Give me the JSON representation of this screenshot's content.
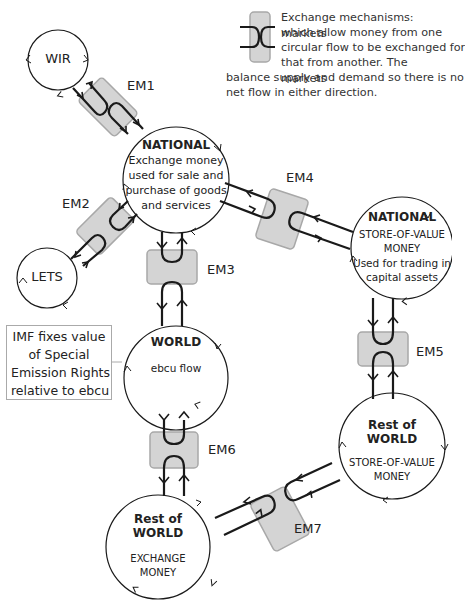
{
  "legend": {
    "icon": "exchange-mechanism-icon",
    "text_lines": [
      "Exchange mechanisms: markets",
      "which allow money from one",
      "circular flow to be exchanged for",
      "that from another. The markets",
      "balance supply and demand so there is no",
      "net flow in either direction."
    ]
  },
  "nodes": {
    "wir": {
      "label": "WIR"
    },
    "lets": {
      "label": "LETS"
    },
    "national_exchange": {
      "title": "NATIONAL",
      "lines": [
        "Exchange money",
        "used for sale and",
        "purchase of goods",
        "and services"
      ]
    },
    "national_store": {
      "title": "NATIONAL",
      "lines": [
        "STORE-OF-VALUE",
        "MONEY",
        "Used for trading in",
        "capital assets"
      ]
    },
    "world": {
      "title": "WORLD",
      "subtitle": "ebcu flow"
    },
    "rest_world_store": {
      "title_lines": [
        "Rest of",
        "WORLD"
      ],
      "lines": [
        "STORE-OF-VALUE",
        "MONEY"
      ]
    },
    "rest_world_exchange": {
      "title_lines": [
        "Rest of",
        "WORLD"
      ],
      "lines": [
        "EXCHANGE",
        "MONEY"
      ]
    }
  },
  "exchange_mechanisms": [
    {
      "id": "EM1",
      "label": "EM1"
    },
    {
      "id": "EM2",
      "label": "EM2"
    },
    {
      "id": "EM3",
      "label": "EM3"
    },
    {
      "id": "EM4",
      "label": "EM4"
    },
    {
      "id": "EM5",
      "label": "EM5"
    },
    {
      "id": "EM6",
      "label": "EM6"
    },
    {
      "id": "EM7",
      "label": "EM7"
    }
  ],
  "annotation": {
    "lines": [
      "IMF fixes value",
      "of Special",
      "Emission Rights",
      "relative to ebcu"
    ]
  },
  "colors": {
    "em_fill": "#d4d4d4",
    "em_stroke": "#a8a8a8",
    "line": "#1a1a1a",
    "annotation_border": "#aaaaaa"
  }
}
